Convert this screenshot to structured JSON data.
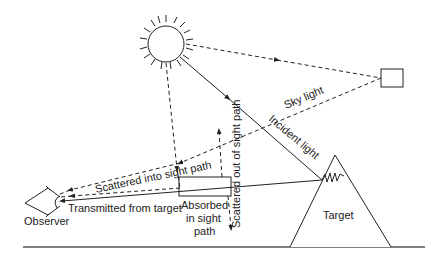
{
  "diagram": {
    "type": "atmospheric-light-path-schematic",
    "colors": {
      "line": "#222222",
      "background": "#ffffff"
    },
    "labels": {
      "sky_light": "Sky light",
      "incident_light": "Incident light",
      "scattered_out": "Scattered out of sight path",
      "scattered_into": "Scattered into sight path",
      "transmitted": "Transmitted from target",
      "absorbed_line1": "Absorbed",
      "absorbed_line2": "in sight",
      "absorbed_line3": "path",
      "observer": "Observer",
      "target": "Target"
    },
    "nodes": [
      {
        "id": "sun",
        "label": ""
      },
      {
        "id": "sky-scatterer",
        "label": ""
      },
      {
        "id": "observer",
        "label": "Observer"
      },
      {
        "id": "sight-path-volume",
        "label": "Absorbed in sight path"
      },
      {
        "id": "target",
        "label": "Target"
      }
    ],
    "edges": [
      {
        "from": "sun",
        "to": "target",
        "style": "solid",
        "label": "Incident light"
      },
      {
        "from": "sun",
        "to": "sky-scatterer",
        "style": "dashed",
        "label": ""
      },
      {
        "from": "sky-scatterer",
        "to": "observer",
        "style": "dashed",
        "label": "Sky light"
      },
      {
        "from": "sun",
        "to": "sight-path-volume",
        "style": "dashed",
        "label": ""
      },
      {
        "from": "sight-path-volume",
        "to": "observer",
        "style": "dashed",
        "label": "Scattered into sight path"
      },
      {
        "from": "target",
        "to": "observer",
        "style": "solid",
        "label": "Transmitted from target"
      },
      {
        "from": "sight-path-volume",
        "to": "out-up",
        "style": "dashed",
        "label": "Scattered out of sight path"
      },
      {
        "from": "sight-path-volume",
        "to": "out-down",
        "style": "dashed",
        "label": ""
      }
    ]
  }
}
